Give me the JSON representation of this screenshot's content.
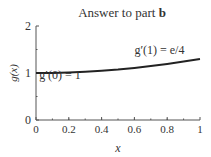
{
  "chart_data": {
    "type": "line",
    "title_prefix": "Answer to part ",
    "title_bold": "b",
    "xlabel": "x",
    "ylabel": "g(x)",
    "xlim": [
      0,
      1
    ],
    "ylim": [
      0,
      2
    ],
    "x_ticks": [
      "0",
      "0.2",
      "0.4",
      "0.6",
      "0.8",
      "1"
    ],
    "y_ticks": [
      "0",
      "1",
      "2"
    ],
    "grid": false,
    "series": [
      {
        "name": "g(x)",
        "x": [
          0,
          0.1,
          0.2,
          0.3,
          0.4,
          0.5,
          0.6,
          0.7,
          0.8,
          0.9,
          1.0
        ],
        "values": [
          1.0,
          1.003,
          1.012,
          1.027,
          1.048,
          1.075,
          1.108,
          1.147,
          1.192,
          1.243,
          1.3
        ]
      }
    ],
    "annotations": [
      {
        "text": "g′(0) = 1",
        "x": 0.02,
        "y": 0.87
      },
      {
        "text": "g′(1) = e/4",
        "x": 0.6,
        "y": 1.4
      }
    ]
  }
}
